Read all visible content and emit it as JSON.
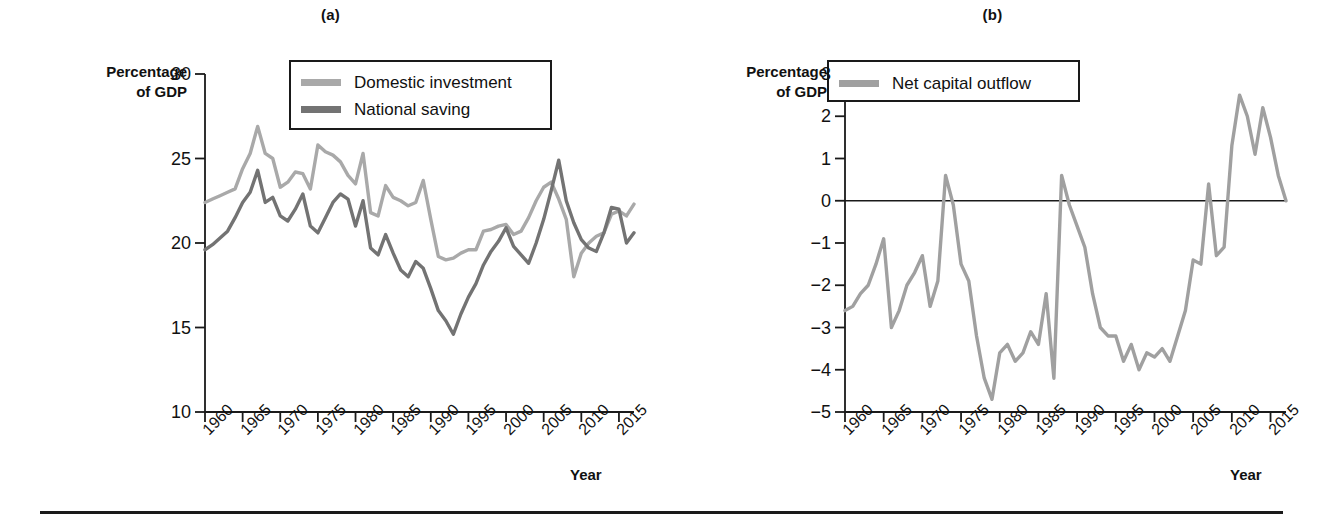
{
  "figure": {
    "bottom_rule": true,
    "background": "#ffffff"
  },
  "panels": [
    {
      "id": "a",
      "title": "(a)",
      "y_axis_title": "Percentage\nof GDP",
      "y_axis_title_line1": "Percentage",
      "y_axis_title_line2": "of GDP",
      "x_axis_title": "Year",
      "legend": [
        {
          "label": "Domestic investment",
          "color": "#a9a9a9"
        },
        {
          "label": "National saving",
          "color": "#737373"
        }
      ]
    },
    {
      "id": "b",
      "title": "(b)",
      "y_axis_title_line1": "Percentage",
      "y_axis_title_line2": "of GDP",
      "x_axis_title": "Year",
      "legend": [
        {
          "label": "Net capital outflow",
          "color": "#a0a0a0"
        }
      ]
    }
  ],
  "chart_data": [
    {
      "type": "line",
      "title": "(a)",
      "xlabel": "Year",
      "ylabel": "Percentage of GDP",
      "xlim": [
        1960,
        2017
      ],
      "ylim": [
        10,
        30
      ],
      "yticks": [
        10,
        15,
        20,
        25,
        30
      ],
      "xticks": [
        1960,
        1965,
        1970,
        1975,
        1980,
        1985,
        1990,
        1995,
        2000,
        2005,
        2010,
        2015
      ],
      "xticklabels": [
        "1960",
        "1965",
        "1970",
        "1975",
        "1980",
        "1985",
        "1990",
        "1995",
        "2000",
        "2005",
        "2010",
        "2015"
      ],
      "yticklabels": [
        "10",
        "15",
        "20",
        "25",
        "30"
      ],
      "grid": false,
      "legend_position": "top-center",
      "x": [
        1960,
        1961,
        1962,
        1963,
        1964,
        1965,
        1966,
        1967,
        1968,
        1969,
        1970,
        1971,
        1972,
        1973,
        1974,
        1975,
        1976,
        1977,
        1978,
        1979,
        1980,
        1981,
        1982,
        1983,
        1984,
        1985,
        1986,
        1987,
        1988,
        1989,
        1990,
        1991,
        1992,
        1993,
        1994,
        1995,
        1996,
        1997,
        1998,
        1999,
        2000,
        2001,
        2002,
        2003,
        2004,
        2005,
        2006,
        2007,
        2008,
        2009,
        2010,
        2011,
        2012,
        2013,
        2014,
        2015,
        2016,
        2017
      ],
      "series": [
        {
          "name": "Domestic investment",
          "color": "#a9a9a9",
          "values": [
            22.4,
            22.6,
            22.8,
            23.0,
            23.2,
            24.4,
            25.3,
            26.9,
            25.3,
            25.0,
            23.3,
            23.6,
            24.2,
            24.1,
            23.2,
            25.8,
            25.4,
            25.2,
            24.8,
            24.0,
            23.5,
            25.3,
            21.8,
            21.6,
            23.4,
            22.7,
            22.5,
            22.2,
            22.4,
            23.7,
            21.4,
            19.2,
            19.0,
            19.1,
            19.4,
            19.6,
            19.6,
            20.7,
            20.8,
            21.0,
            21.1,
            20.5,
            20.7,
            21.5,
            22.5,
            23.3,
            23.6,
            22.6,
            21.4,
            18.0,
            19.4,
            20.0,
            20.4,
            20.6,
            21.7,
            21.9,
            21.6,
            22.3
          ]
        },
        {
          "name": "National saving",
          "color": "#737373",
          "values": [
            19.6,
            19.9,
            20.3,
            20.7,
            21.5,
            22.4,
            23.0,
            24.3,
            22.4,
            22.7,
            21.6,
            21.3,
            22.0,
            22.9,
            21.0,
            20.6,
            21.5,
            22.4,
            22.9,
            22.6,
            21.0,
            22.5,
            19.7,
            19.3,
            20.5,
            19.4,
            18.4,
            18.0,
            18.9,
            18.5,
            17.3,
            16.0,
            15.4,
            14.6,
            15.8,
            16.8,
            17.6,
            18.7,
            19.5,
            20.1,
            20.9,
            19.8,
            19.3,
            18.8,
            20.0,
            21.4,
            23.1,
            24.9,
            22.5,
            21.2,
            20.2,
            19.7,
            19.5,
            20.6,
            22.1,
            22.0,
            20.0,
            20.6
          ]
        }
      ]
    },
    {
      "type": "line",
      "title": "(b)",
      "xlabel": "Year",
      "ylabel": "Percentage of GDP",
      "xlim": [
        1960,
        2017
      ],
      "ylim": [
        -5,
        3
      ],
      "yticks": [
        -5,
        -4,
        -3,
        -2,
        -1,
        0,
        1,
        2,
        3
      ],
      "yticklabels": [
        "−5",
        "−4",
        "−3",
        "−2",
        "−1",
        "0",
        "1",
        "2",
        "3"
      ],
      "xticks": [
        1960,
        1965,
        1970,
        1975,
        1980,
        1985,
        1990,
        1995,
        2000,
        2005,
        2010,
        2015
      ],
      "xticklabels": [
        "1960",
        "1965",
        "1970",
        "1975",
        "1980",
        "1985",
        "1990",
        "1995",
        "2000",
        "2005",
        "2010",
        "2015"
      ],
      "grid": false,
      "zero_line": true,
      "legend_position": "top-left",
      "x": [
        1960,
        1961,
        1962,
        1963,
        1964,
        1965,
        1966,
        1967,
        1968,
        1969,
        1970,
        1971,
        1972,
        1973,
        1974,
        1975,
        1976,
        1977,
        1978,
        1979,
        1980,
        1981,
        1982,
        1983,
        1984,
        1985,
        1986,
        1987,
        1988,
        1989,
        1990,
        1991,
        1992,
        1993,
        1994,
        1995,
        1996,
        1997,
        1998,
        1999,
        2000,
        2001,
        2002,
        2003,
        2004,
        2005,
        2006,
        2007,
        2008,
        2009,
        2010,
        2011,
        2012,
        2013,
        2014,
        2015,
        2016,
        2017
      ],
      "series": [
        {
          "name": "Net capital outflow",
          "color": "#a0a0a0",
          "values": [
            -2.6,
            -2.5,
            -2.2,
            -2.0,
            -1.5,
            -0.9,
            -3.0,
            -2.6,
            -2.0,
            -1.7,
            -1.3,
            -2.5,
            -1.9,
            0.6,
            -0.1,
            -1.5,
            -1.9,
            -3.2,
            -4.2,
            -4.7,
            -3.6,
            -3.4,
            -3.8,
            -3.6,
            -3.1,
            -3.4,
            -2.2,
            -4.2,
            0.6,
            -0.1,
            -0.6,
            -1.1,
            -2.2,
            -3.0,
            -3.2,
            -3.2,
            -3.8,
            -3.4,
            -4.0,
            -3.6,
            -3.7,
            -3.5,
            -3.8,
            -3.2,
            -2.6,
            -1.4,
            -1.5,
            0.4,
            -1.3,
            -1.1,
            1.3,
            2.5,
            2.0,
            1.1,
            2.2,
            1.5,
            0.6,
            0.0,
            -3.3,
            -3.8,
            -2.6,
            -3.5,
            -3.8,
            -2.6,
            -3.4,
            -3.6,
            -2.7,
            -3.0
          ]
        }
      ]
    }
  ]
}
